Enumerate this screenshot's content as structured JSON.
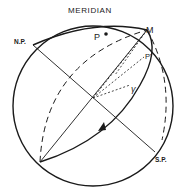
{
  "diagram": {
    "title": "MERIDIAN",
    "labels": {
      "north_pole": "N.P.",
      "south_pole": "S.P.",
      "m": "M",
      "p": "P",
      "p_prime": "P'",
      "gamma": "γ"
    },
    "colors": {
      "ink": "#1a1a1a",
      "background": "#ffffff"
    }
  }
}
